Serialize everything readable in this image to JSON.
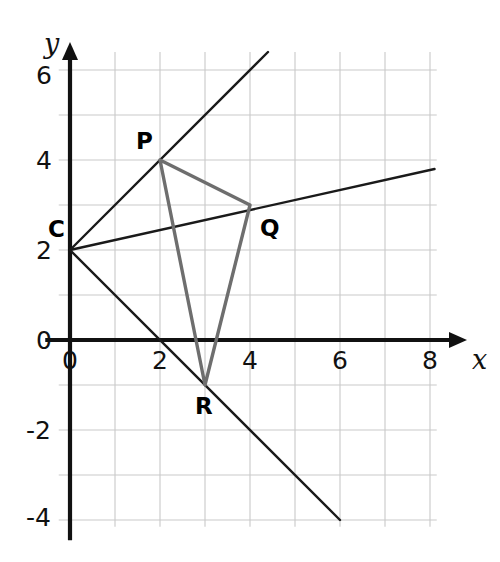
{
  "chart_data": {
    "type": "scatter",
    "title": "",
    "xlabel": "x",
    "ylabel": "y",
    "xlim": [
      -0.6,
      9.0
    ],
    "ylim": [
      -4.6,
      6.9
    ],
    "grid": true,
    "legend": null,
    "x_ticks": [
      "0",
      "2",
      "4",
      "6",
      "8"
    ],
    "x_tick_values": [
      0,
      2,
      4,
      6,
      8
    ],
    "y_ticks": [
      "6",
      "4",
      "2",
      "0",
      "-2",
      "-4"
    ],
    "y_tick_values": [
      6,
      4,
      2,
      0,
      -2,
      -4
    ],
    "points": [
      {
        "name": "C",
        "label": "C",
        "x": 0,
        "y": 2,
        "label_dx": -22,
        "label_dy": -32
      },
      {
        "name": "P",
        "label": "P",
        "x": 2,
        "y": 4,
        "label_dx": -24,
        "label_dy": -30
      },
      {
        "name": "Q",
        "label": "Q",
        "x": 4,
        "y": 3,
        "label_dx": 10,
        "label_dy": 12
      },
      {
        "name": "R",
        "label": "R",
        "x": 3,
        "y": -1,
        "label_dx": -10,
        "label_dy": 10
      }
    ],
    "lines": [
      {
        "name": "line-through-C-and-P",
        "color": "#1a1a1a",
        "width": 2.4,
        "from": [
          0,
          2
        ],
        "to": [
          4.4,
          6.4
        ]
      },
      {
        "name": "line-through-C-and-Q",
        "color": "#1a1a1a",
        "width": 2.4,
        "from": [
          0,
          2
        ],
        "to": [
          8.1,
          3.8
        ]
      },
      {
        "name": "line-through-C-and-R",
        "color": "#1a1a1a",
        "width": 2.4,
        "from": [
          0,
          2
        ],
        "to": [
          6.0,
          -4.0
        ]
      }
    ],
    "triangle": {
      "name": "triangle-PQR",
      "vertices": [
        [
          2,
          4
        ],
        [
          4,
          3
        ],
        [
          3,
          -1
        ]
      ],
      "stroke": "#6e6e6e",
      "width": 3.4,
      "fill": "none"
    },
    "colors": {
      "grid": "#c9c9c9",
      "axis": "#111111",
      "line": "#1a1a1a",
      "triangle": "#6e6e6e",
      "background": "#ffffff"
    }
  },
  "labels": {
    "x_axis_name": "x",
    "y_axis_name": "y"
  }
}
